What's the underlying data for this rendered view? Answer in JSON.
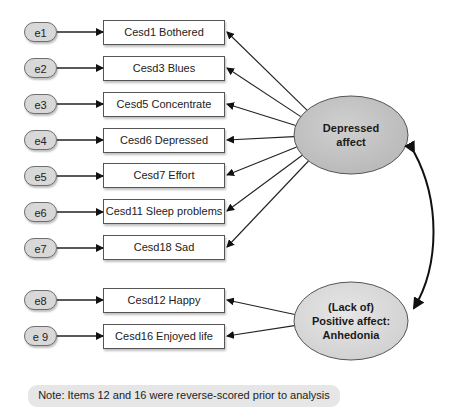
{
  "errors": [
    {
      "label": "e1",
      "y": 22
    },
    {
      "label": "e2",
      "y": 58
    },
    {
      "label": "e3",
      "y": 94
    },
    {
      "label": "e4",
      "y": 130
    },
    {
      "label": "e5",
      "y": 166
    },
    {
      "label": "e6",
      "y": 202
    },
    {
      "label": "e7",
      "y": 238
    },
    {
      "label": "e8",
      "y": 290
    },
    {
      "label": "e 9",
      "y": 326
    }
  ],
  "items": [
    {
      "label": "Cesd1 Bothered",
      "y": 20,
      "factor": "depressed"
    },
    {
      "label": "Cesd3 Blues",
      "y": 56,
      "factor": "depressed"
    },
    {
      "label": "Cesd5 Concentrate",
      "y": 92,
      "factor": "depressed"
    },
    {
      "label": "Cesd6 Depressed",
      "y": 128,
      "factor": "depressed"
    },
    {
      "label": "Cesd7 Effort",
      "y": 163,
      "factor": "depressed"
    },
    {
      "label": "Cesd11 Sleep problems",
      "y": 199,
      "factor": "depressed"
    },
    {
      "label": "Cesd18 Sad",
      "y": 235,
      "factor": "depressed"
    },
    {
      "label": "Cesd12 Happy",
      "y": 288,
      "factor": "positive"
    },
    {
      "label": "Cesd16 Enjoyed life",
      "y": 324,
      "factor": "positive"
    }
  ],
  "factors": {
    "depressed": {
      "line1": "Depressed",
      "line2": "affect",
      "line3": ""
    },
    "positive": {
      "line1": "(Lack of)",
      "line2": "Positive affect:",
      "line3": "Anhedonia"
    }
  },
  "note": "Note: Items 12 and 16 were reverse-scored prior to analysis",
  "colors": {
    "factor_fill": "#c4c4c4",
    "factor2_fill": "#d9d9d9",
    "error_fill": "#d8d8d8",
    "line": "#222222"
  }
}
